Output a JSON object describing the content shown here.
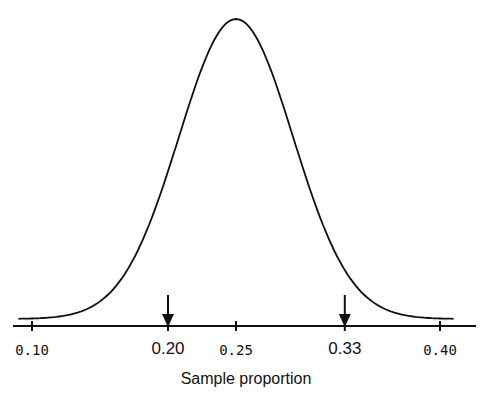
{
  "chart_data": {
    "type": "line",
    "title": "",
    "xlabel": "Sample proportion",
    "ylabel": "",
    "distribution": {
      "kind": "normal",
      "mean": 0.25,
      "sd": 0.042
    },
    "xlim": [
      0.085,
      0.42
    ],
    "x_ticks": [
      {
        "value": 0.1,
        "label": "0.10",
        "emphasized": false
      },
      {
        "value": 0.2,
        "label": "0.20",
        "emphasized": true
      },
      {
        "value": 0.25,
        "label": "0.25",
        "emphasized": false
      },
      {
        "value": 0.33,
        "label": "0.33",
        "emphasized": true
      },
      {
        "value": 0.4,
        "label": "0.40",
        "emphasized": false
      }
    ],
    "annotations": [
      {
        "type": "arrow",
        "x": 0.2,
        "direction": "down"
      },
      {
        "type": "arrow",
        "x": 0.33,
        "direction": "down"
      }
    ],
    "curve_range": [
      0.09,
      0.41
    ],
    "grid": false,
    "legend": null,
    "colors": {
      "line": "#111111",
      "background": "#ffffff"
    }
  }
}
